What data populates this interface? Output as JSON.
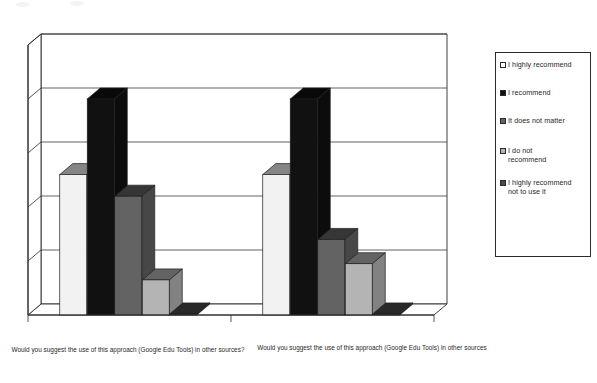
{
  "chart_data": {
    "type": "bar",
    "title": "",
    "subtitle": "",
    "xlabel": "",
    "ylabel": "",
    "grid": true,
    "three_d": true,
    "legend_position": "right",
    "ylim": [
      0,
      5
    ],
    "y_tick_labels": [],
    "gridline_count": 5,
    "categories": [
      "Would you suggest the use of this approach (Google Edu Tools) in other sources?",
      "Would you suggest the use of this approach (Google Edu Tools) in other sources"
    ],
    "series": [
      {
        "name": "I highly recommend",
        "color": "#f2f2f2",
        "values": [
          2.6,
          2.6
        ]
      },
      {
        "name": "I recommend",
        "color": "#111111",
        "values": [
          4.0,
          4.0
        ]
      },
      {
        "name": "It does not matter",
        "color": "#636363",
        "values": [
          2.2,
          1.4
        ]
      },
      {
        "name": "I do not recommend",
        "color": "#b4b4b4",
        "values": [
          0.65,
          0.95
        ]
      },
      {
        "name": "I highly recommend not to use it",
        "color": "#4a4a4a",
        "values": [
          0.02,
          0.02
        ]
      }
    ]
  },
  "legend": {
    "items": [
      {
        "label": "I highly recommend",
        "swatch_color": "#ffffff"
      },
      {
        "label": "I recommend",
        "swatch_color": "#111111"
      },
      {
        "label": "It does not matter",
        "swatch_color": "#636363"
      },
      {
        "label": "I do not\nrecommend",
        "swatch_color": "#b4b4b4"
      },
      {
        "label": "I highly recommend\nnot to use it",
        "swatch_color": "#4a4a4a"
      }
    ]
  },
  "axis": {
    "category_labels": [
      "Would you suggest the use of this approach (Google Edu Tools) in\nother sources?",
      "Would you suggest the use of this approach (Google Edu Tools) in\nother sources"
    ]
  },
  "colors": {
    "axis_line": "#2b2b2b",
    "gridline": "#3a3a3a",
    "floor": "#6e6e6e",
    "background": "#ffffff"
  }
}
